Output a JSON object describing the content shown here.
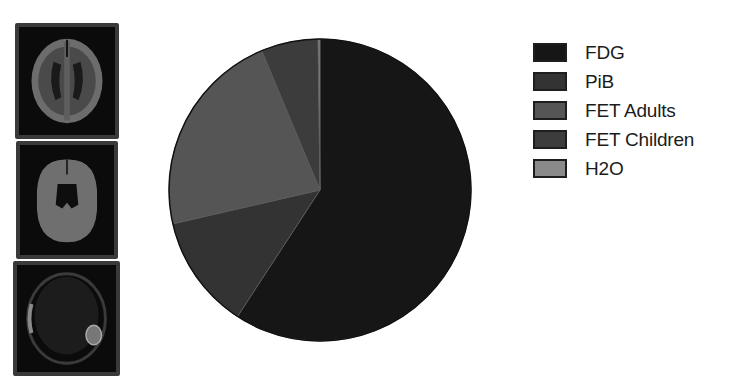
{
  "brain_panels": [
    {
      "name": "brain-scan-fdg",
      "x": 15,
      "y": 23,
      "w": 104,
      "h": 116,
      "style": "fdg"
    },
    {
      "name": "brain-scan-pib",
      "x": 16,
      "y": 141,
      "w": 102,
      "h": 118,
      "style": "pib"
    },
    {
      "name": "brain-scan-fet",
      "x": 13,
      "y": 261,
      "w": 107,
      "h": 115,
      "style": "fet"
    }
  ],
  "chart_data": {
    "type": "pie",
    "title": "",
    "start_angle_deg": 0,
    "direction": "clockwise",
    "categories": [
      "FDG",
      "PiB",
      "FET Adults",
      "FET Children",
      "H2O"
    ],
    "values": [
      59.2,
      12.2,
      22.3,
      6.1,
      0.2
    ],
    "unit": "percent (estimated from slice angles)",
    "colors": [
      "#161616",
      "#333333",
      "#555555",
      "#3c3c3c",
      "#8a8a8a"
    ],
    "center": [
      320,
      190
    ],
    "radius": 151,
    "legend": {
      "position": "right",
      "entries": [
        "FDG",
        "PiB",
        "FET Adults",
        "FET Children",
        "H2O"
      ]
    }
  }
}
